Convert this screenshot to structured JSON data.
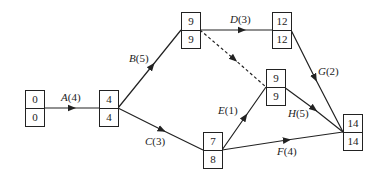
{
  "nodes": [
    {
      "id": "n1",
      "top": "0",
      "bottom": "0"
    },
    {
      "id": "n2",
      "top": "4",
      "bottom": "4"
    },
    {
      "id": "n3",
      "top": "9",
      "bottom": "9"
    },
    {
      "id": "n4",
      "top": "12",
      "bottom": "12"
    },
    {
      "id": "n5",
      "top": "9",
      "bottom": "9"
    },
    {
      "id": "n6",
      "top": "7",
      "bottom": "8"
    },
    {
      "id": "n7",
      "top": "14",
      "bottom": "14"
    }
  ],
  "activities": [
    {
      "name": "A",
      "duration": "(4)",
      "from": "n1",
      "to": "n2"
    },
    {
      "name": "B",
      "duration": "(5)",
      "from": "n2",
      "to": "n3"
    },
    {
      "name": "C",
      "duration": "(3)",
      "from": "n2",
      "to": "n6"
    },
    {
      "name": "D",
      "duration": "(3)",
      "from": "n3",
      "to": "n4"
    },
    {
      "name": "E",
      "duration": "(1)",
      "from": "n6",
      "to": "n5"
    },
    {
      "name": "F",
      "duration": "(4)",
      "from": "n6",
      "to": "n7"
    },
    {
      "name": "G",
      "duration": "(2)",
      "from": "n4",
      "to": "n7"
    },
    {
      "name": "H",
      "duration": "(5)",
      "from": "n5",
      "to": "n7"
    }
  ],
  "dummy": {
    "from": "n3",
    "to": "n5",
    "style": "dashed"
  },
  "colors": {
    "line": "#222222",
    "background": "#ffffff"
  }
}
